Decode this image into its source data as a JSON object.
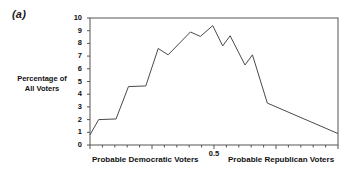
{
  "figure": {
    "panel_label": "(a)"
  },
  "axes": {
    "y_axis_label_line1": "Percentage of",
    "y_axis_label_line2": "All Voters",
    "y_ticks": [
      "0",
      "1",
      "2",
      "3",
      "4",
      "5",
      "6",
      "7",
      "8",
      "9",
      "10"
    ],
    "x_tick_label": "0.5",
    "x_left_caption": "Probable Democratic Voters",
    "x_right_caption": "Probable Republican Voters"
  },
  "colors": {
    "line": "#4a4a4a",
    "axis": "#555555",
    "text": "#111111",
    "background": "#ffffff"
  },
  "chart_data": {
    "type": "line",
    "title": "",
    "subtitle": "",
    "xlabel": "",
    "ylabel": "Percentage of All Voters",
    "xlim": [
      0,
      1
    ],
    "ylim": [
      0,
      10
    ],
    "grid": false,
    "legend": false,
    "x_tick_values": [
      0.5
    ],
    "y_tick_values": [
      0,
      1,
      2,
      3,
      4,
      5,
      6,
      7,
      8,
      9,
      10
    ],
    "x_minor_ticks": 20,
    "annotations": [
      {
        "text": "(a)",
        "position": "top-left-outside"
      },
      {
        "text": "Probable Democratic Voters",
        "position": "bottom-left"
      },
      {
        "text": "Probable Republican Voters",
        "position": "bottom-right"
      }
    ],
    "series": [
      {
        "name": "Percentage of All Voters",
        "x": [
          0.0,
          0.035,
          0.105,
          0.155,
          0.225,
          0.275,
          0.315,
          0.405,
          0.445,
          0.495,
          0.535,
          0.565,
          0.625,
          0.655,
          0.715,
          1.0
        ],
        "values": [
          0.8,
          2.0,
          2.05,
          4.6,
          4.65,
          7.6,
          7.1,
          8.9,
          8.55,
          9.4,
          7.8,
          8.6,
          6.3,
          7.1,
          3.3,
          0.9
        ]
      }
    ]
  }
}
